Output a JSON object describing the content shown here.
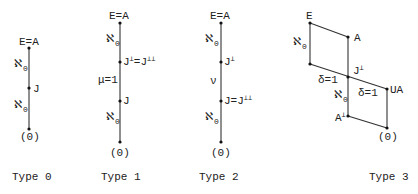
{
  "diagrams": [
    {
      "caption": "Type 0",
      "nodes": {
        "top": "E=A",
        "middle": "J",
        "bottom": "(0)"
      },
      "edges": {
        "upper": "ℵ",
        "upper_sub": "0",
        "lower": "ℵ",
        "lower_sub": "0"
      }
    },
    {
      "caption": "Type 1",
      "nodes": {
        "top": "E=A",
        "upper_mid_base": "J",
        "upper_mid_sup1": "⊥",
        "upper_mid_eq": "=J",
        "upper_mid_sup2": "⊥⊥",
        "lower_mid": "J",
        "bottom": "(0)"
      },
      "edges": {
        "upper": "ℵ",
        "upper_sub": "0",
        "middle": "μ=1",
        "lower": "ℵ",
        "lower_sub": "0"
      }
    },
    {
      "caption": "Type 2",
      "nodes": {
        "top": "E=A",
        "upper_mid_base": "J",
        "upper_mid_sup": "⊥",
        "lower_mid_base": "J=J",
        "lower_mid_sup": "⊥⊥",
        "bottom": "(0)"
      },
      "edges": {
        "upper": "ℵ",
        "upper_sub": "0",
        "middle": "ν",
        "lower": "ℵ",
        "lower_sub": "0"
      }
    },
    {
      "caption": "Type 3",
      "nodes": {
        "E": "E",
        "A": "A",
        "J_base": "J",
        "J_sup": "⊥",
        "UA": "UA",
        "Aperp_base": "A",
        "Aperp_sup": "⊥",
        "zero": "(0)"
      },
      "edges": {
        "left": "ℵ",
        "left_sub": "0",
        "delta_left": "δ=1",
        "delta_right": "δ=1",
        "center": "ℵ",
        "center_sub": "0"
      }
    }
  ]
}
